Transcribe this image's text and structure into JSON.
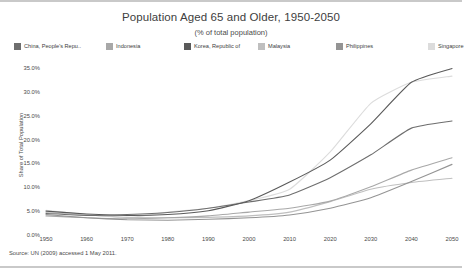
{
  "chart_data": {
    "type": "line",
    "title": "Population Aged 65 and Older, 1950-2050",
    "subtitle": "(% of total population)",
    "xlabel": "",
    "ylabel": "Share of Total Population",
    "source": "Source: UN (2009) accessed 1 May 2011.",
    "x": [
      1950,
      1960,
      1970,
      1980,
      1990,
      2000,
      2010,
      2020,
      2030,
      2040,
      2050
    ],
    "xticks": [
      "1950",
      "1960",
      "1970",
      "1980",
      "1990",
      "2000",
      "2010",
      "2020",
      "2030",
      "2040",
      "2050"
    ],
    "yticks": [
      "0.0%",
      "5.0%",
      "10.0%",
      "15.0%",
      "20.0%",
      "25.0%",
      "30.0%",
      "35.0%"
    ],
    "ytickvalues": [
      0,
      5,
      10,
      15,
      20,
      25,
      30,
      35
    ],
    "xlim": [
      1950,
      2050
    ],
    "ylim": [
      0,
      35
    ],
    "grid": false,
    "legend_position": "top",
    "series": [
      {
        "name": "China, People's Repu..",
        "color": "#6e6e6e",
        "values": [
          4.5,
          4.1,
          4.3,
          4.7,
          5.6,
          6.9,
          8.4,
          12.0,
          16.8,
          22.4,
          23.9
        ]
      },
      {
        "name": "Indonesia",
        "color": "#a8a8a8",
        "values": [
          4.0,
          3.6,
          3.4,
          3.6,
          4.0,
          4.8,
          5.6,
          7.1,
          10.1,
          13.6,
          16.2
        ]
      },
      {
        "name": "Korea, Republic of",
        "color": "#5a5a5a",
        "values": [
          5.0,
          4.4,
          4.1,
          4.3,
          5.1,
          7.2,
          11.1,
          15.7,
          23.3,
          32.0,
          34.9
        ]
      },
      {
        "name": "Malaysia",
        "color": "#bfbfbf",
        "values": [
          4.7,
          4.2,
          3.7,
          3.6,
          3.7,
          4.0,
          4.8,
          7.0,
          9.6,
          11.0,
          11.9
        ]
      },
      {
        "name": "Philippines",
        "color": "#949494",
        "values": [
          4.3,
          3.6,
          3.2,
          3.1,
          3.3,
          3.6,
          4.2,
          5.6,
          7.8,
          11.2,
          14.8
        ]
      },
      {
        "name": "Singapore",
        "color": "#dcdcdc",
        "values": [
          5.2,
          4.3,
          3.6,
          4.8,
          5.6,
          7.2,
          9.6,
          17.4,
          27.6,
          32.0,
          33.3
        ]
      }
    ]
  }
}
